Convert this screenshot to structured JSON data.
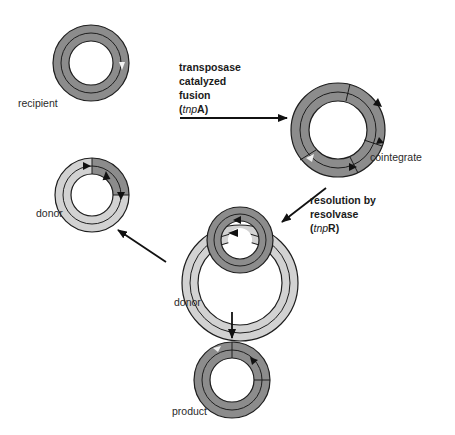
{
  "diagram": {
    "title": "",
    "type": "process-flow",
    "colors": {
      "dark_dna": "#8c8c8c",
      "light_dna": "#d2d2d2",
      "outline": "#1e1e1e",
      "arrow": "#111111",
      "background": "#ffffff"
    },
    "nodes": [
      {
        "id": "recipient",
        "label": "recipient",
        "shape": "circular-plasmid",
        "fill": "dark"
      },
      {
        "id": "donor-top",
        "label": "donor",
        "shape": "circular-plasmid",
        "fill": "light-with-dark-transposon"
      },
      {
        "id": "cointegrate",
        "label": "cointegrate",
        "shape": "circular-plasmid",
        "fill": "dark-with-two-transposons"
      },
      {
        "id": "donor-bottom",
        "label": "donor",
        "shape": "intertwined-plasmids",
        "fill": "light-and-dark"
      },
      {
        "id": "product",
        "label": "product",
        "shape": "circular-plasmid",
        "fill": "dark-with-transposon"
      }
    ],
    "edges": [
      {
        "from": "recipient",
        "to": "cointegrate",
        "label_lines": [
          "transposase",
          "catalyzed",
          "fusion"
        ],
        "enzyme_prefix": "tnp",
        "enzyme_suffix": "A"
      },
      {
        "from": "cointegrate",
        "to": "donor-bottom",
        "label_lines": [
          "resolution by",
          "resolvase"
        ],
        "enzyme_prefix": "tnp",
        "enzyme_suffix": "R"
      },
      {
        "from": "donor-bottom",
        "to": "donor-top",
        "label_lines": []
      },
      {
        "from": "donor-bottom",
        "to": "product",
        "label_lines": []
      }
    ]
  },
  "labels": {
    "recipient": "recipient",
    "donor_top": "donor",
    "cointegrate": "cointegrate",
    "donor_bottom": "donor",
    "product": "product"
  },
  "steps": {
    "fusion": {
      "line1": "transposase",
      "line2": "catalyzed",
      "line3": "fusion",
      "enzyme_prefix": "tnp",
      "enzyme_suffix": "A"
    },
    "resolution": {
      "line1": "resolution by",
      "line2": "resolvase",
      "enzyme_prefix": "tnp",
      "enzyme_suffix": "R"
    }
  }
}
